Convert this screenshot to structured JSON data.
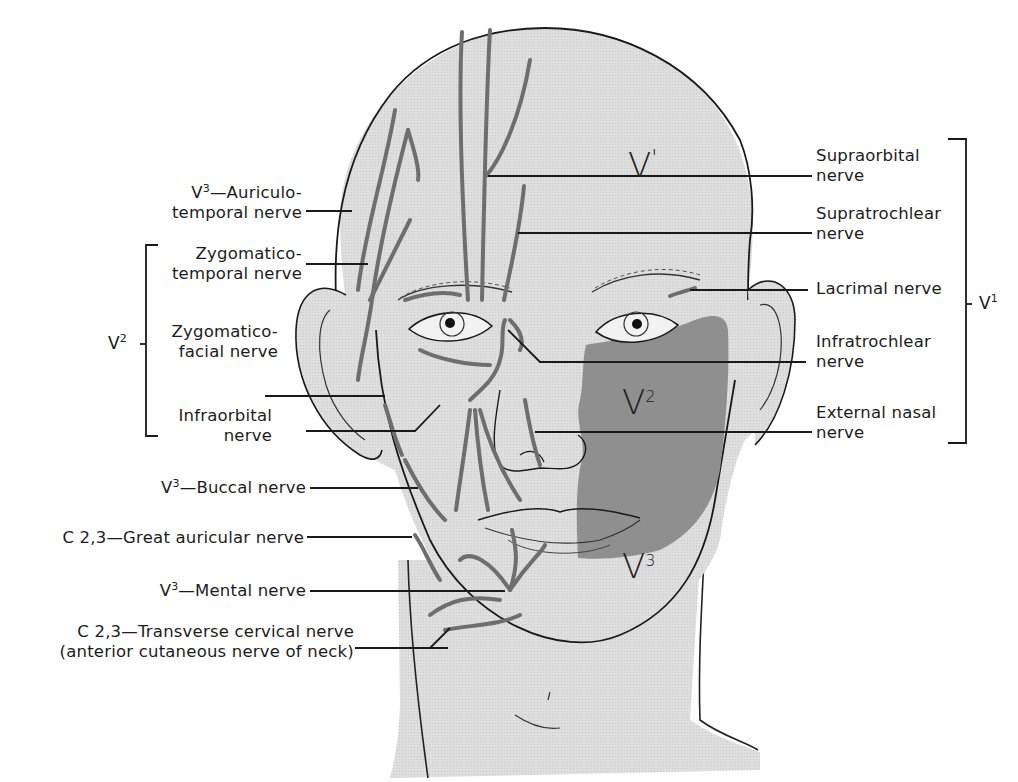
{
  "figure": {
    "colors": {
      "skin": "#dcdcdc",
      "v2_shade": "#8f8f8f",
      "nerve": "#7a7a7a",
      "line": "#1a1a1a",
      "background": "#ffffff"
    }
  },
  "regions": {
    "v1": {
      "base": "V",
      "mark": "'"
    },
    "v2": {
      "base": "V",
      "sup": "2"
    },
    "v3": {
      "base": "V",
      "sup": "3"
    }
  },
  "groups": {
    "left_v2": {
      "base": "V",
      "sup": "2"
    },
    "right_v1": {
      "base": "V",
      "sup": "1"
    }
  },
  "left_labels": [
    {
      "id": "auriculotemporal",
      "line1_prefix": "V",
      "line1_sup": "3",
      "line1_rest": "—Auriculo-",
      "line2": "temporal nerve"
    },
    {
      "id": "zygomaticotemporal",
      "line1": "Zygomatico-",
      "line2": "temporal nerve"
    },
    {
      "id": "zygomaticofacial",
      "line1": "Zygomatico-",
      "line2": "facial nerve"
    },
    {
      "id": "infraorbital",
      "line1": "Infraorbital",
      "line2": "nerve"
    },
    {
      "id": "buccal",
      "prefix": "V",
      "sup": "3",
      "rest": "—Buccal nerve"
    },
    {
      "id": "great-auricular",
      "text": "C 2,3—Great auricular nerve"
    },
    {
      "id": "mental",
      "prefix": "V",
      "sup": "3",
      "rest": "—Mental nerve"
    },
    {
      "id": "transverse-cervical",
      "line1": "C 2,3—Transverse cervical nerve",
      "line2": "(anterior cutaneous nerve of neck)"
    }
  ],
  "right_labels": [
    {
      "id": "supraorbital",
      "line1": "Supraorbital",
      "line2": "nerve"
    },
    {
      "id": "supratrochlear",
      "line1": "Supratrochlear",
      "line2": "nerve"
    },
    {
      "id": "lacrimal",
      "line1": "Lacrimal nerve"
    },
    {
      "id": "infratrochlear",
      "line1": "Infratrochlear",
      "line2": "nerve"
    },
    {
      "id": "external-nasal",
      "line1": "External nasal",
      "line2": "nerve"
    }
  ]
}
